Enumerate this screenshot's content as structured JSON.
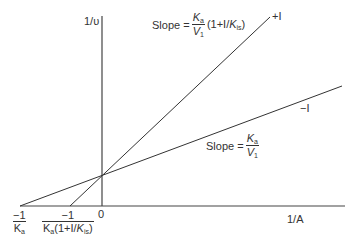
{
  "diagram": {
    "type": "Lineweaver-Burk double reciprocal plot",
    "y_axis_label": "1/υ",
    "x_axis_label": "1/A",
    "origin_label": "0",
    "lines": [
      {
        "name": "with-inhibitor",
        "label": "+I",
        "slope_label": {
          "prefix": "Slope =",
          "num": "K",
          "num_sub": "a",
          "den": "V",
          "den_sub": "1",
          "suffix_a": "(1+I/",
          "suffix_k": "K",
          "suffix_sub": "is",
          "suffix_end": ")"
        }
      },
      {
        "name": "without-inhibitor",
        "label": "−I",
        "slope_label": {
          "prefix": "Slope =",
          "num": "K",
          "num_sub": "a",
          "den": "V",
          "den_sub": "1"
        }
      }
    ],
    "x_intercepts": [
      {
        "name": "no-inhibitor-intercept",
        "num": "−1",
        "den": "K",
        "den_sub": "a"
      },
      {
        "name": "inhibitor-intercept",
        "num": "−1",
        "den_a": "K",
        "den_sub": "a",
        "den_b": "(1+I/",
        "den_k": "K",
        "den_k_sub": "is",
        "den_end": ")"
      }
    ],
    "colors": {
      "line": "#333333",
      "text": "#333333",
      "background": "#ffffff"
    }
  }
}
